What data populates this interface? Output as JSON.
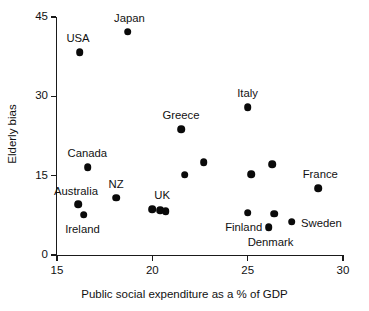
{
  "chart_data": {
    "type": "scatter",
    "title": "",
    "xlabel": "Public social expenditure as a % of GDP",
    "ylabel": "Elderly bias",
    "xlim": [
      15,
      30
    ],
    "ylim": [
      0,
      45
    ],
    "xticks": [
      15,
      20,
      25,
      30
    ],
    "yticks": [
      0,
      15,
      30,
      45
    ],
    "grid": false,
    "legend": "none",
    "marker": "filled-circle",
    "marker_color": "#0a0a0a",
    "points": [
      {
        "label": "USA",
        "x": 16.2,
        "y": 38.4,
        "label_dx": -2,
        "label_dy": -13
      },
      {
        "label": "Japan",
        "x": 18.7,
        "y": 42.2,
        "label_dx": 2,
        "label_dy": -13
      },
      {
        "label": "Canada",
        "x": 16.6,
        "y": 16.6,
        "label_dx": 0,
        "label_dy": -13
      },
      {
        "label": "Australia",
        "x": 16.1,
        "y": 9.6,
        "label_dx": -2,
        "label_dy": -12
      },
      {
        "label": "Ireland",
        "x": 16.4,
        "y": 7.6,
        "label_dx": -1,
        "label_dy": 15
      },
      {
        "label": "NZ",
        "x": 18.1,
        "y": 10.8,
        "label_dx": 0,
        "label_dy": -13
      },
      {
        "label": "UK",
        "x": 20.0,
        "y": 8.7,
        "label_dx": 10,
        "label_dy": -13
      },
      {
        "label": "",
        "x": 20.4,
        "y": 8.5,
        "label_dx": 0,
        "label_dy": 0
      },
      {
        "label": "",
        "x": 20.7,
        "y": 8.3,
        "label_dx": 0,
        "label_dy": 0
      },
      {
        "label": "Greece",
        "x": 21.5,
        "y": 23.8,
        "label_dx": 0,
        "label_dy": -13
      },
      {
        "label": "",
        "x": 21.7,
        "y": 15.2,
        "label_dx": 0,
        "label_dy": 0
      },
      {
        "label": "",
        "x": 22.7,
        "y": 17.5,
        "label_dx": 0,
        "label_dy": 0
      },
      {
        "label": "Italy",
        "x": 25.0,
        "y": 28.0,
        "label_dx": 0,
        "label_dy": -13
      },
      {
        "label": "",
        "x": 25.2,
        "y": 15.3,
        "label_dx": 0,
        "label_dy": 0
      },
      {
        "label": "Finland",
        "x": 25.0,
        "y": 8.0,
        "label_dx": -4,
        "label_dy": 15
      },
      {
        "label": "",
        "x": 26.3,
        "y": 17.2,
        "label_dx": 0,
        "label_dy": 0
      },
      {
        "label": "",
        "x": 26.4,
        "y": 7.8,
        "label_dx": 0,
        "label_dy": 0
      },
      {
        "label": "Denmark",
        "x": 26.1,
        "y": 5.2,
        "label_dx": 2,
        "label_dy": 16
      },
      {
        "label": "Sweden",
        "x": 27.3,
        "y": 6.3,
        "label_dx": 30,
        "label_dy": 2
      },
      {
        "label": "France",
        "x": 28.7,
        "y": 12.6,
        "label_dx": 2,
        "label_dy": -13
      }
    ]
  },
  "axes": {
    "x_tick_labels": [
      "15",
      "20",
      "25",
      "30"
    ],
    "y_tick_labels": [
      "0",
      "15",
      "30",
      "45"
    ],
    "x_title": "Public social expenditure as a % of GDP",
    "y_title": "Elderly bias"
  }
}
